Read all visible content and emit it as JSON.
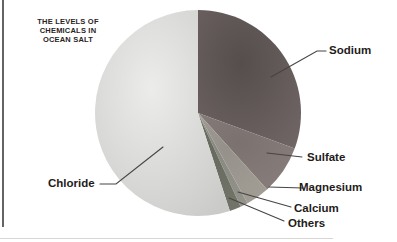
{
  "chart_data": {
    "type": "pie",
    "title": "THE LEVELS OF\nCHEMICALS IN\nOCEAN SALT",
    "units": "percent",
    "legend": "none",
    "labels_placement": "outside-with-leader-lines",
    "start_angle_deg_from_top_clockwise": 0,
    "slices": [
      {
        "label": "Sodium",
        "value": 30.6,
        "color": "#635957",
        "gradient": {
          "inner": "#554e4d",
          "outer": "#6f6564"
        }
      },
      {
        "label": "Sulfate",
        "value": 7.7,
        "color": "#827977",
        "gradient": {
          "inner": "#7b7270",
          "outer": "#887d7a"
        }
      },
      {
        "label": "Magnesium",
        "value": 3.7,
        "color": "#9b968d",
        "gradient": {
          "inner": "#95908a",
          "outer": "#a39e95"
        }
      },
      {
        "label": "Calcium",
        "value": 1.2,
        "color": "#8f8e86",
        "gradient": {
          "inner": "#8a8981",
          "outer": "#94938b"
        }
      },
      {
        "label": "Others",
        "value": 1.8,
        "color": "#6e7064",
        "gradient": {
          "inner": "#676a5e",
          "outer": "#73756a"
        }
      },
      {
        "label": "Chloride",
        "value": 55.0,
        "color": "#d9d9d7",
        "gradient": {
          "inner": "#ececea",
          "outer": "#cacac8"
        }
      }
    ]
  }
}
